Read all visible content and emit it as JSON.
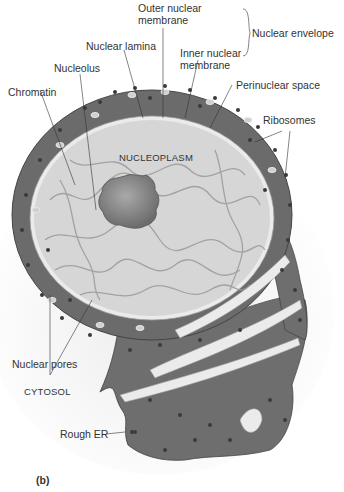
{
  "figure": {
    "panel_label": "(b)",
    "labels": {
      "outer_nuclear_membrane_1": "Outer nuclear",
      "outer_nuclear_membrane_2": "membrane",
      "nuclear_envelope": "Nuclear envelope",
      "nuclear_lamina": "Nuclear lamina",
      "inner_nuclear_membrane_1": "Inner nuclear",
      "inner_nuclear_membrane_2": "membrane",
      "nucleolus": "Nucleolus",
      "chromatin": "Chromatin",
      "perinuclear_space": "Perinuclear space",
      "ribosomes": "Ribosomes",
      "nucleoplasm": "NUCLEOPLASM",
      "nuclear_pores": "Nuclear pores",
      "cytosol": "CYTOSOL",
      "rough_er": "Rough ER"
    },
    "colors": {
      "er_fill": "#6e6e6e",
      "nucleoplasm_fill": "#d6d6d6",
      "membrane_light": "#ebebeb",
      "nucleolus": "#7a7a7a",
      "ribosome": "#3a3a3a",
      "cytosol_bg": "#f2f2f2"
    }
  }
}
